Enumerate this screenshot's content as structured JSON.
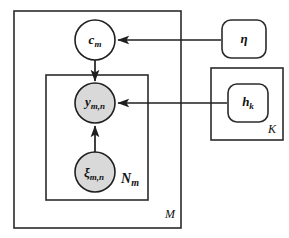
{
  "figure": {
    "type": "plate-notation-graphical-model",
    "background_color": "#ffffff",
    "stroke_color": "#1f1f1f",
    "shaded_node_color": "#d9d9d9",
    "open_node_color": "#ffffff",
    "width": 289,
    "height": 238
  },
  "nodes": [
    {
      "id": "c_m",
      "shape": "circle",
      "shaded": false,
      "symbol": "c",
      "subscript": "m",
      "cx": 95,
      "cy": 40,
      "r": 20
    },
    {
      "id": "y_mn",
      "shape": "circle",
      "shaded": true,
      "symbol": "y",
      "subscript": "m,n",
      "cx": 95,
      "cy": 103,
      "r": 20
    },
    {
      "id": "xi_mn",
      "shape": "circle",
      "shaded": true,
      "symbol": "ξ",
      "subscript": "m,n",
      "cx": 95,
      "cy": 172,
      "r": 20
    },
    {
      "id": "eta",
      "shape": "rounded-box",
      "shaded": false,
      "symbol": "η",
      "subscript": "",
      "x": 222,
      "y": 20,
      "w": 44,
      "h": 38
    },
    {
      "id": "h_k",
      "shape": "rounded-box",
      "shaded": false,
      "symbol": "h",
      "subscript": "k",
      "x": 228,
      "y": 83,
      "w": 40,
      "h": 38
    }
  ],
  "plates": [
    {
      "id": "plate_M",
      "label": "M",
      "label_x": 169,
      "label_y": 215,
      "x": 14,
      "y": 11,
      "w": 167,
      "h": 217
    },
    {
      "id": "plate_Nm",
      "label": "N",
      "label_subscript": "m",
      "label_x": 131,
      "label_y": 181,
      "x": 46,
      "y": 75,
      "w": 102,
      "h": 125
    },
    {
      "id": "plate_K",
      "label": "K",
      "label_x": 272,
      "label_y": 129,
      "x": 211,
      "y": 68,
      "w": 72,
      "h": 72
    }
  ],
  "edges": [
    {
      "id": "edge-cm-to-ymn",
      "from": "c_m",
      "to": "y_mn",
      "direction": "down",
      "arrowhead": true
    },
    {
      "id": "edge-ximn-to-ymn",
      "from": "xi_mn",
      "to": "y_mn",
      "direction": "up",
      "arrowhead": true
    },
    {
      "id": "edge-eta-to-cm",
      "from": "eta",
      "to": "c_m",
      "direction": "left",
      "arrowhead": true
    },
    {
      "id": "edge-hk-to-ymn",
      "from": "h_k",
      "to": "y_mn",
      "direction": "left",
      "arrowhead": true
    }
  ],
  "labels": {
    "c_m_symbol": "c",
    "c_m_sub": "m",
    "y_symbol": "y",
    "y_sub": "m,n",
    "xi_symbol": "ξ",
    "xi_sub": "m,n",
    "eta_symbol": "η",
    "h_symbol": "h",
    "h_sub": "k",
    "plate_M_label": "M",
    "plate_N_label": "N",
    "plate_N_sub": "m",
    "plate_K_label": "K"
  }
}
